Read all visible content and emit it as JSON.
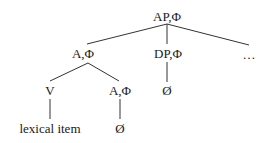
{
  "diagram": {
    "type": "syntax-tree",
    "nodes": {
      "root": {
        "label": "AP,Φ"
      },
      "a_phi_upper": {
        "label": "A,Φ"
      },
      "dp_phi": {
        "label": "DP,Φ"
      },
      "ellipsis": {
        "label": "…"
      },
      "v": {
        "label": "V"
      },
      "a_phi_lower": {
        "label": "A,Φ"
      },
      "dp_empty": {
        "label": "Ø"
      },
      "lexical_item": {
        "label": "lexical item"
      },
      "a_empty": {
        "label": "Ø"
      }
    },
    "edges": [
      [
        "root",
        "a_phi_upper"
      ],
      [
        "root",
        "dp_phi"
      ],
      [
        "root",
        "ellipsis"
      ],
      [
        "a_phi_upper",
        "v"
      ],
      [
        "a_phi_upper",
        "a_phi_lower"
      ],
      [
        "dp_phi",
        "dp_empty"
      ],
      [
        "v",
        "lexical_item"
      ],
      [
        "a_phi_lower",
        "a_empty"
      ]
    ]
  }
}
